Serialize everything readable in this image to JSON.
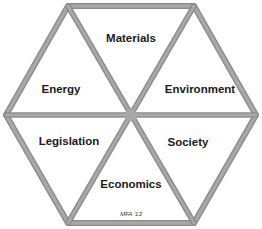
{
  "diagram": {
    "type": "hexagon-segmented",
    "segments": [
      {
        "label": "Materials",
        "position": "top"
      },
      {
        "label": "Environment",
        "position": "upper-right"
      },
      {
        "label": "Society",
        "position": "lower-right"
      },
      {
        "label": "Economics",
        "position": "bottom"
      },
      {
        "label": "Legislation",
        "position": "lower-left"
      },
      {
        "label": "Energy",
        "position": "upper-left"
      }
    ],
    "credit": "MFA '13",
    "colors": {
      "line": "#9c9c9c",
      "line_shadow": "#7a7a7a",
      "fill": "#ffffff",
      "text": "#1a1a1a"
    }
  }
}
